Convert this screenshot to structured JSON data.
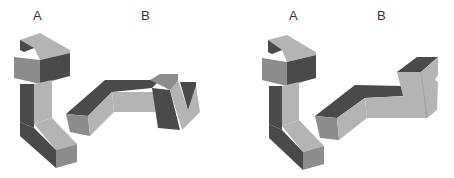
{
  "figure": {
    "panels": [
      {
        "id": "left",
        "labels": {
          "a": "A",
          "b": "B"
        },
        "description": "Shape A and rotated shape B (non-matching pair)"
      },
      {
        "id": "right",
        "labels": {
          "a": "A",
          "b": "B"
        },
        "description": "Shape A and rotated shape B (matching pair)"
      }
    ],
    "colors": {
      "light": "#b4b4b4",
      "medium": "#8c8c8c",
      "dark": "#4a4a4a",
      "background": "#ffffff"
    }
  }
}
